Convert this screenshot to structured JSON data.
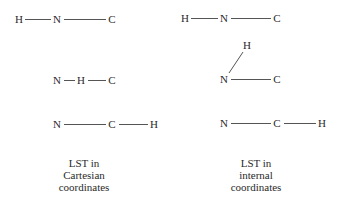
{
  "left": {
    "caption": [
      "LST in",
      "Cartesian",
      "coordinates"
    ],
    "rows": [
      {
        "atoms": [
          "H",
          "N",
          "C"
        ]
      },
      {
        "atoms": [
          "N",
          "H",
          "C"
        ]
      },
      {
        "atoms": [
          "N",
          "C",
          "H"
        ]
      }
    ]
  },
  "right": {
    "caption": [
      "LST in",
      "internal",
      "coordinates"
    ],
    "rows": [
      {
        "atoms": [
          "H",
          "N",
          "C"
        ]
      },
      {
        "atoms": [
          "H",
          "N",
          "C"
        ]
      },
      {
        "atoms": [
          "N",
          "C",
          "H"
        ]
      }
    ]
  }
}
